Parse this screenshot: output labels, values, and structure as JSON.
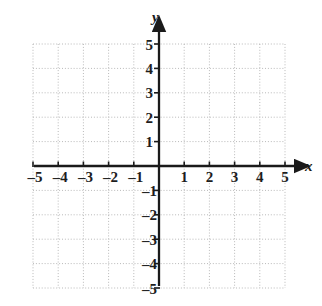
{
  "figure": {
    "kind": "cartesian-coordinate-plane",
    "width": 322,
    "height": 306,
    "background_color": "#ffffff"
  },
  "axes": {
    "x_axis_label": "x",
    "y_axis_label": "y",
    "axis_color": "#1a1a1a",
    "grid_color": "#b9b9b9",
    "origin_label": "",
    "x_range": [
      -5,
      5
    ],
    "y_range": [
      -5,
      5
    ],
    "step": 1,
    "grid": "dotted",
    "arrowheads": [
      "x-positive",
      "y-positive"
    ]
  },
  "x_ticks": {
    "negative": [
      "–5",
      "–4",
      "–3",
      "–2",
      "–1"
    ],
    "positive": [
      "1",
      "2",
      "3",
      "4",
      "5"
    ]
  },
  "y_ticks": {
    "positive": [
      "5",
      "4",
      "3",
      "2",
      "1"
    ],
    "negative": [
      "–1",
      "–2",
      "–3",
      "–4",
      "–5"
    ]
  },
  "chart_data": {
    "type": "scatter",
    "title": "",
    "xlabel": "x",
    "ylabel": "y",
    "xlim": [
      -5,
      5
    ],
    "ylim": [
      -5,
      5
    ],
    "xticks": [
      -5,
      -4,
      -3,
      -2,
      -1,
      1,
      2,
      3,
      4,
      5
    ],
    "yticks": [
      -5,
      -4,
      -3,
      -2,
      -1,
      1,
      2,
      3,
      4,
      5
    ],
    "grid": true,
    "legend": null,
    "series": [
      {
        "name": "plotted-points",
        "x": [],
        "y": []
      }
    ],
    "annotations": []
  }
}
